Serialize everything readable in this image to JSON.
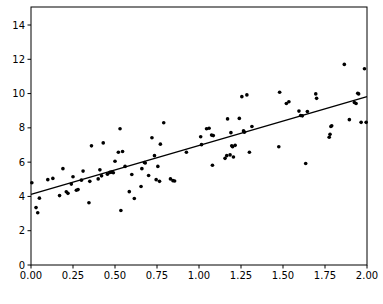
{
  "chart_data": {
    "type": "scatter",
    "title": "",
    "xlabel": "",
    "ylabel": "",
    "xlim": [
      0.0,
      2.0
    ],
    "ylim": [
      0.0,
      15.05
    ],
    "grid": false,
    "legend": null,
    "xticks": [
      0.0,
      0.25,
      0.5,
      0.75,
      1.0,
      1.25,
      1.5,
      1.75,
      2.0
    ],
    "xtick_labels": [
      "0.00",
      "0.25",
      "0.50",
      "0.75",
      "1.00",
      "1.25",
      "1.50",
      "1.75",
      "2.00"
    ],
    "yticks": [
      0,
      2,
      4,
      6,
      8,
      10,
      12,
      14
    ],
    "ytick_labels": [
      "0",
      "2",
      "4",
      "6",
      "8",
      "10",
      "12",
      "14"
    ],
    "series": [
      {
        "name": "observations",
        "type": "scatter",
        "marker": "circle",
        "color": "#000000",
        "marker_size": 3,
        "points": [
          [
            0.005,
            4.8
          ],
          [
            0.03,
            3.35
          ],
          [
            0.04,
            3.05
          ],
          [
            0.05,
            3.9
          ],
          [
            0.1,
            4.98
          ],
          [
            0.13,
            5.05
          ],
          [
            0.17,
            4.05
          ],
          [
            0.19,
            5.62
          ],
          [
            0.21,
            4.27
          ],
          [
            0.22,
            4.18
          ],
          [
            0.24,
            4.72
          ],
          [
            0.25,
            5.15
          ],
          [
            0.27,
            4.36
          ],
          [
            0.28,
            4.4
          ],
          [
            0.3,
            4.95
          ],
          [
            0.31,
            5.48
          ],
          [
            0.345,
            3.63
          ],
          [
            0.35,
            4.88
          ],
          [
            0.36,
            6.95
          ],
          [
            0.4,
            5.02
          ],
          [
            0.41,
            5.55
          ],
          [
            0.42,
            5.2
          ],
          [
            0.43,
            7.12
          ],
          [
            0.455,
            5.3
          ],
          [
            0.47,
            5.4
          ],
          [
            0.48,
            5.42
          ],
          [
            0.49,
            5.38
          ],
          [
            0.5,
            6.05
          ],
          [
            0.52,
            6.58
          ],
          [
            0.53,
            7.95
          ],
          [
            0.535,
            3.18
          ],
          [
            0.545,
            6.62
          ],
          [
            0.56,
            5.75
          ],
          [
            0.585,
            4.28
          ],
          [
            0.6,
            5.28
          ],
          [
            0.615,
            3.88
          ],
          [
            0.655,
            4.58
          ],
          [
            0.66,
            5.62
          ],
          [
            0.675,
            5.98
          ],
          [
            0.68,
            5.95
          ],
          [
            0.7,
            5.22
          ],
          [
            0.72,
            7.42
          ],
          [
            0.735,
            6.38
          ],
          [
            0.745,
            4.98
          ],
          [
            0.755,
            5.75
          ],
          [
            0.765,
            4.88
          ],
          [
            0.77,
            7.05
          ],
          [
            0.79,
            8.3
          ],
          [
            0.83,
            5.02
          ],
          [
            0.845,
            4.92
          ],
          [
            0.855,
            4.9
          ],
          [
            0.925,
            6.58
          ],
          [
            1.01,
            7.48
          ],
          [
            1.015,
            7.02
          ],
          [
            1.045,
            7.95
          ],
          [
            1.06,
            7.98
          ],
          [
            1.075,
            7.58
          ],
          [
            1.08,
            5.82
          ],
          [
            1.085,
            7.55
          ],
          [
            1.155,
            6.22
          ],
          [
            1.165,
            6.38
          ],
          [
            1.17,
            8.52
          ],
          [
            1.185,
            6.42
          ],
          [
            1.19,
            7.72
          ],
          [
            1.195,
            6.95
          ],
          [
            1.2,
            6.9
          ],
          [
            1.205,
            6.3
          ],
          [
            1.215,
            6.98
          ],
          [
            1.24,
            8.55
          ],
          [
            1.255,
            9.82
          ],
          [
            1.265,
            7.82
          ],
          [
            1.27,
            7.75
          ],
          [
            1.285,
            9.92
          ],
          [
            1.3,
            6.58
          ],
          [
            1.315,
            8.08
          ],
          [
            1.475,
            6.9
          ],
          [
            1.48,
            10.08
          ],
          [
            1.52,
            9.42
          ],
          [
            1.535,
            9.52
          ],
          [
            1.595,
            8.98
          ],
          [
            1.605,
            8.72
          ],
          [
            1.615,
            8.7
          ],
          [
            1.635,
            5.92
          ],
          [
            1.645,
            8.95
          ],
          [
            1.695,
            9.98
          ],
          [
            1.7,
            9.72
          ],
          [
            1.775,
            7.45
          ],
          [
            1.78,
            7.62
          ],
          [
            1.785,
            8.08
          ],
          [
            1.79,
            8.12
          ],
          [
            1.865,
            11.7
          ],
          [
            1.895,
            8.48
          ],
          [
            1.925,
            9.48
          ],
          [
            1.935,
            9.42
          ],
          [
            1.945,
            10.02
          ],
          [
            1.95,
            9.98
          ],
          [
            1.965,
            8.32
          ],
          [
            1.985,
            11.45
          ],
          [
            1.995,
            8.32
          ]
        ]
      },
      {
        "name": "linear-fit",
        "type": "line",
        "color": "#000000",
        "endpoints": [
          [
            0.0,
            4.12
          ],
          [
            2.0,
            9.82
          ]
        ],
        "slope": 2.85,
        "intercept": 4.12
      }
    ]
  },
  "axes": {
    "top_spine": true,
    "right_spine": true,
    "bottom_spine": true,
    "left_spine": true,
    "tick_direction": "out"
  }
}
